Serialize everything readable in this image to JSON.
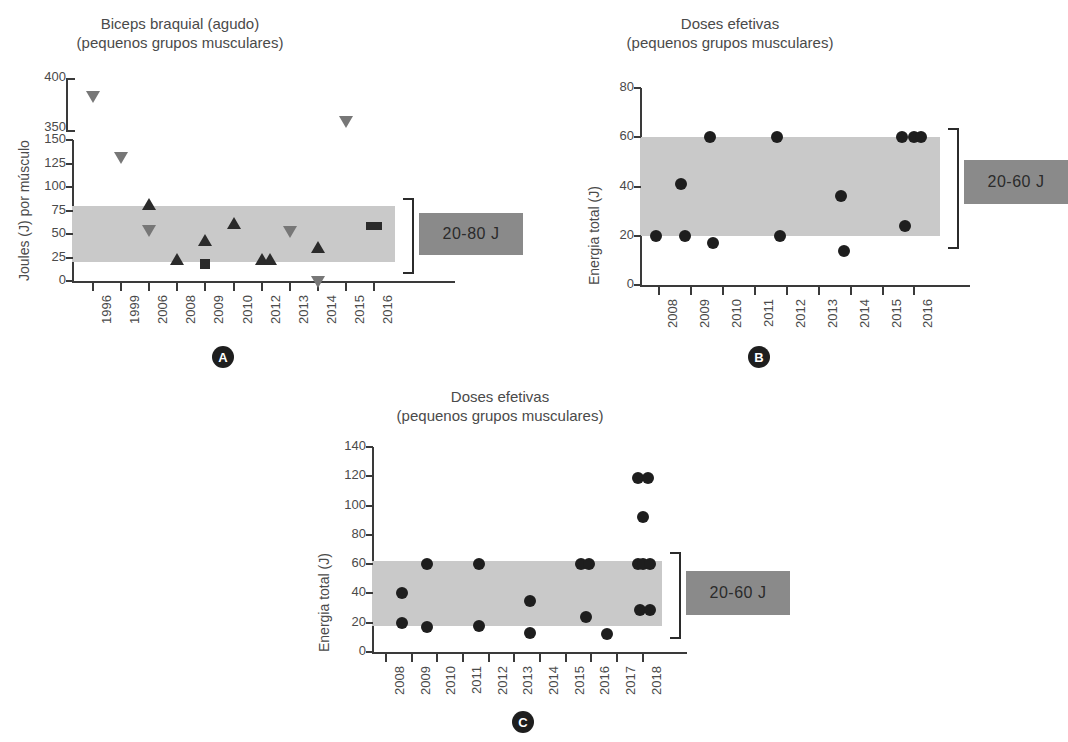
{
  "figure": {
    "panels": [
      {
        "id": "A",
        "label": "A",
        "title_line1": "Biceps braquial (agudo)",
        "title_line2": "(pequenos grupos musculares)",
        "ylabel": "Joules (J) por músculo",
        "xlabel": "",
        "legend_text": "20-80 J",
        "band": [
          20,
          80
        ],
        "yticks_lower": [
          "0",
          "25",
          "50",
          "75",
          "100",
          "125",
          "150"
        ],
        "yticks_upper": [
          "350",
          "400"
        ],
        "xticks": [
          "1996",
          "1999",
          "2006",
          "2008",
          "2009",
          "2010",
          "2012",
          "2013",
          "2014",
          "2015",
          "2016"
        ]
      },
      {
        "id": "B",
        "label": "B",
        "title_line1": "Doses efetivas",
        "title_line2": "(pequenos grupos musculares)",
        "ylabel": "Energia total (J)",
        "xlabel": "",
        "legend_text": "20-60 J",
        "band": [
          20,
          60
        ],
        "yticks": [
          "0",
          "20",
          "40",
          "60",
          "80"
        ],
        "xticks": [
          "2008",
          "2009",
          "2010",
          "2011",
          "2012",
          "2013",
          "2014",
          "2015",
          "2016"
        ]
      },
      {
        "id": "C",
        "label": "C",
        "title_line1": "Doses efetivas",
        "title_line2": "(pequenos grupos musculares)",
        "ylabel": "Energia total (J)",
        "xlabel": "",
        "legend_text": "20-60 J",
        "band": [
          20,
          60
        ],
        "yticks": [
          "0",
          "20",
          "40",
          "60",
          "80",
          "100",
          "120",
          "140"
        ],
        "xticks": [
          "2008",
          "2009",
          "2010",
          "2011",
          "2012",
          "2013",
          "2014",
          "2015",
          "2016",
          "2017",
          "2018"
        ]
      }
    ]
  },
  "chart_data": [
    {
      "type": "scatter",
      "panel": "A",
      "title": "Biceps braquial (agudo) (pequenos grupos musculares)",
      "xlabel": "",
      "ylabel": "Joules (J) por músculo",
      "ylim": [
        0,
        150
      ],
      "ylim_upper": [
        350,
        400
      ],
      "axis_break": true,
      "yticks": [
        0,
        25,
        50,
        75,
        100,
        125,
        150,
        350,
        400
      ],
      "xticks": [
        1996,
        1999,
        2006,
        2008,
        2009,
        2010,
        2012,
        2013,
        2014,
        2015,
        2016
      ],
      "shaded_band": {
        "label": "20-80 J",
        "ymin": 20,
        "ymax": 80
      },
      "grid": false,
      "legend": "right",
      "series": [
        {
          "name": "triangulo-para-baixo",
          "marker": "triangle-down",
          "color": "#777777",
          "points": [
            {
              "x": 1996,
              "y": 385
            },
            {
              "x": 1999,
              "y": 135
            },
            {
              "x": 2006,
              "y": 57
            },
            {
              "x": 2013,
              "y": 56
            },
            {
              "x": 2014,
              "y": 3
            },
            {
              "x": 2015,
              "y": 360
            }
          ]
        },
        {
          "name": "triangulo-para-cima",
          "marker": "triangle-up",
          "color": "#2b2b2b",
          "points": [
            {
              "x": 2006,
              "y": 78
            },
            {
              "x": 2008,
              "y": 19
            },
            {
              "x": 2009,
              "y": 39
            },
            {
              "x": 2010,
              "y": 57
            },
            {
              "x": 2012,
              "y": 19
            },
            {
              "x": 2012.3,
              "y": 19
            },
            {
              "x": 2014,
              "y": 32
            }
          ]
        },
        {
          "name": "quadrado",
          "marker": "square",
          "color": "#2b2b2b",
          "points": [
            {
              "x": 2009,
              "y": 18
            },
            {
              "x": 2016,
              "y": 59
            }
          ]
        }
      ]
    },
    {
      "type": "scatter",
      "panel": "B",
      "title": "Doses efetivas (pequenos grupos musculares)",
      "xlabel": "",
      "ylabel": "Energia total (J)",
      "ylim": [
        0,
        80
      ],
      "yticks": [
        0,
        20,
        40,
        60,
        80
      ],
      "xticks": [
        2008,
        2009,
        2010,
        2011,
        2012,
        2013,
        2014,
        2015,
        2016
      ],
      "shaded_band": {
        "label": "20-60 J",
        "ymin": 20,
        "ymax": 60
      },
      "grid": false,
      "legend": "right",
      "series": [
        {
          "name": "estudos",
          "marker": "circle",
          "color": "#1e1e1e",
          "points": [
            {
              "x": 2007.9,
              "y": 20
            },
            {
              "x": 2008.7,
              "y": 41
            },
            {
              "x": 2008.8,
              "y": 20
            },
            {
              "x": 2009.6,
              "y": 60
            },
            {
              "x": 2009.7,
              "y": 17
            },
            {
              "x": 2011.7,
              "y": 60
            },
            {
              "x": 2011.8,
              "y": 20
            },
            {
              "x": 2013.7,
              "y": 36
            },
            {
              "x": 2013.8,
              "y": 14
            },
            {
              "x": 2015.6,
              "y": 60
            },
            {
              "x": 2015.7,
              "y": 24
            },
            {
              "x": 2016.0,
              "y": 60
            },
            {
              "x": 2016.2,
              "y": 60
            }
          ]
        }
      ]
    },
    {
      "type": "scatter",
      "panel": "C",
      "title": "Doses efetivas (pequenos grupos musculares)",
      "xlabel": "",
      "ylabel": "Energia total (J)",
      "ylim": [
        0,
        140
      ],
      "yticks": [
        0,
        20,
        40,
        60,
        80,
        100,
        120,
        140
      ],
      "xticks": [
        2008,
        2009,
        2010,
        2011,
        2012,
        2013,
        2014,
        2015,
        2016,
        2017,
        2018
      ],
      "shaded_band": {
        "label": "20-60 J",
        "ymin": 20,
        "ymax": 60
      },
      "grid": false,
      "legend": "right",
      "series": [
        {
          "name": "estudos",
          "marker": "circle",
          "color": "#1e1e1e",
          "points": [
            {
              "x": 2008.6,
              "y": 40
            },
            {
              "x": 2008.6,
              "y": 20
            },
            {
              "x": 2009.6,
              "y": 60
            },
            {
              "x": 2009.6,
              "y": 17
            },
            {
              "x": 2011.6,
              "y": 60
            },
            {
              "x": 2011.6,
              "y": 18
            },
            {
              "x": 2013.6,
              "y": 35
            },
            {
              "x": 2013.6,
              "y": 13
            },
            {
              "x": 2015.6,
              "y": 60
            },
            {
              "x": 2015.9,
              "y": 60
            },
            {
              "x": 2015.8,
              "y": 24
            },
            {
              "x": 2016.6,
              "y": 12
            },
            {
              "x": 2017.8,
              "y": 119
            },
            {
              "x": 2018.2,
              "y": 119
            },
            {
              "x": 2018.0,
              "y": 92
            },
            {
              "x": 2017.8,
              "y": 60
            },
            {
              "x": 2018.0,
              "y": 60
            },
            {
              "x": 2018.3,
              "y": 60
            },
            {
              "x": 2017.9,
              "y": 29
            },
            {
              "x": 2018.3,
              "y": 29
            }
          ]
        }
      ]
    }
  ]
}
